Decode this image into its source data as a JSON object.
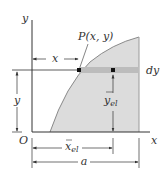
{
  "figure": {
    "labels": {
      "y_axis": "y",
      "x_axis": "x",
      "origin": "O",
      "point": "P(x, y)",
      "x_dim": "x",
      "y_dim": "y",
      "dy": "dy",
      "y_el": "y",
      "y_el_sub": "el",
      "x_el": "x",
      "x_el_sub": "el",
      "a_dim": "a"
    },
    "colors": {
      "region_fill": "#d9d9d9",
      "strip_fill": "#bdbdbd",
      "line": "#333333",
      "curve": "#8a8a8a"
    }
  }
}
